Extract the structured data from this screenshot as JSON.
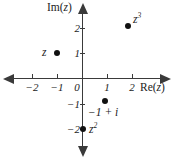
{
  "chart_data": {
    "type": "scatter",
    "title": "",
    "xlabel": "Re(z)",
    "ylabel": "Im(z)",
    "xlim": [
      -2.75,
      2.9
    ],
    "ylim": [
      -2.8,
      2.75
    ],
    "grid": false,
    "legend": "none",
    "xticks": [
      -2,
      -1,
      0,
      1,
      2
    ],
    "xtick_labels": [
      "−2",
      "−1",
      "0",
      "1",
      "2"
    ],
    "yticks": [
      2,
      1,
      -1,
      -2
    ],
    "ytick_labels": [
      "2",
      "1",
      "−1",
      "−2"
    ],
    "points": [
      {
        "label": "z",
        "x": -1,
        "y": 1,
        "label_position": "left"
      },
      {
        "label": "z³",
        "x": 2,
        "y": 2.1,
        "label_position": "upper-right"
      },
      {
        "label": "−1 + i",
        "x": 1,
        "y": -1,
        "label_position": "below"
      },
      {
        "label": "z²",
        "x": 0,
        "y": -2,
        "label_position": "right"
      }
    ],
    "series": [
      {
        "name": "complex points",
        "x": [
          -1,
          2,
          1,
          0
        ],
        "y": [
          1,
          2.1,
          -1,
          -2
        ]
      }
    ],
    "colors": {
      "axis": "#3a3a3a",
      "point": "#111111",
      "text": "#1c1c1c",
      "background": "#ffffff"
    }
  },
  "axes": {
    "x_title_prefix": "Re(",
    "x_title_var": "z",
    "x_title_suffix": ")",
    "y_title_prefix": "Im(",
    "y_title_var": "z",
    "y_title_suffix": ")"
  },
  "xticks": [
    {
      "label": "−2",
      "left": 23,
      "top": 82,
      "tick_left": 32
    },
    {
      "label": "−1",
      "left": 48,
      "top": 82,
      "tick_left": 57
    },
    {
      "label": "0",
      "left": 68,
      "top": 82,
      "tick_left": 83
    },
    {
      "label": "1",
      "left": 98,
      "top": 82,
      "tick_left": 107
    },
    {
      "label": "2",
      "left": 123,
      "top": 82,
      "tick_left": 132
    }
  ],
  "yticks": [
    {
      "label": "2",
      "left": 62,
      "top": 23,
      "tick_top": 28
    },
    {
      "label": "1",
      "left": 62,
      "top": 48,
      "tick_top": 53
    },
    {
      "label": "−1",
      "left": 62,
      "top": 99,
      "tick_top": 104
    },
    {
      "label": "−2",
      "left": 62,
      "top": 124,
      "tick_top": 129
    }
  ],
  "points": [
    {
      "name": "point-z",
      "dot_left": 54,
      "dot_top": 50,
      "label_main": "z",
      "label_sup": "",
      "label_left": 42,
      "label_top": 47
    },
    {
      "name": "point-z-cubed",
      "dot_left": 125,
      "dot_top": 23,
      "label_main": "z",
      "label_sup": "3",
      "label_left": 133,
      "label_top": 14
    },
    {
      "name": "point-minus-one-plus-i",
      "dot_left": 102,
      "dot_top": 98,
      "label_main": "−1 + i",
      "label_sup": "",
      "label_left": 88,
      "label_top": 107
    },
    {
      "name": "point-z-squared",
      "dot_left": 80,
      "dot_top": 126,
      "label_main": "z",
      "label_sup": "2",
      "label_left": 89,
      "label_top": 124
    }
  ]
}
